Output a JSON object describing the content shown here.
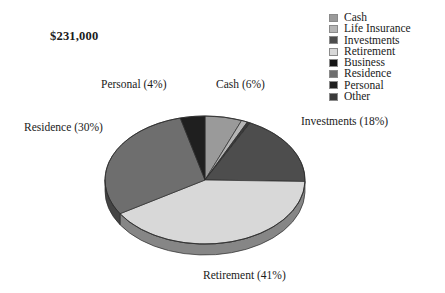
{
  "title": "$231,000",
  "background": "#ffffff",
  "legend": {
    "position": "top-right",
    "items": [
      {
        "label": "Cash",
        "color": "#9a9a9a"
      },
      {
        "label": "Life Insurance",
        "color": "#b5b5b5"
      },
      {
        "label": "Investments",
        "color": "#4d4d4d"
      },
      {
        "label": "Retirement",
        "color": "#d8d8d8"
      },
      {
        "label": "Business",
        "color": "#151515"
      },
      {
        "label": "Residence",
        "color": "#6e6e6e"
      },
      {
        "label": "Personal",
        "color": "#1f1f1f"
      },
      {
        "label": "Other",
        "color": "#3a3a3a"
      }
    ]
  },
  "callouts": {
    "personal": "Personal (4%)",
    "cash": "Cash (6%)",
    "investments": "Investments (18%)",
    "residence": "Residence (30%)",
    "retirement": "Retirement (41%)"
  },
  "chart_data": {
    "type": "pie",
    "title": "$231,000",
    "subtitle": "",
    "xlabel": "",
    "ylabel": "",
    "style": "3d-pie",
    "total_label": "$231,000",
    "legend_position": "top-right",
    "grid": false,
    "labels": [
      "Cash",
      "Life Insurance",
      "Other",
      "Investments",
      "Retirement",
      "Residence",
      "Personal"
    ],
    "values": [
      6,
      1,
      0.5,
      18,
      41,
      30,
      4
    ],
    "unit": "percent",
    "colors": [
      "#9a9a9a",
      "#b5b5b5",
      "#3a3a3a",
      "#4d4d4d",
      "#d8d8d8",
      "#6e6e6e",
      "#1f1f1f"
    ],
    "slice_labels": [
      "Cash (6%)",
      "",
      "",
      "Investments (18%)",
      "Retirement (41%)",
      "Residence (30%)",
      "Personal (4%)"
    ],
    "series": [
      {
        "name": "Asset allocation",
        "categories": [
          "Cash",
          "Life Insurance",
          "Other",
          "Investments",
          "Retirement",
          "Residence",
          "Personal"
        ],
        "values": [
          6,
          1,
          0.5,
          18,
          41,
          30,
          4
        ]
      }
    ],
    "annotations": [
      {
        "text": "$231,000",
        "role": "total"
      }
    ]
  }
}
